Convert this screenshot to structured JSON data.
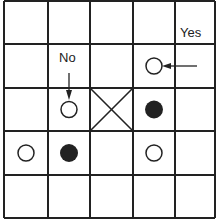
{
  "board": {
    "rows": 5,
    "cols": 5,
    "x_lines": [
      4,
      48,
      90,
      133,
      175,
      215
    ],
    "y_lines": [
      1,
      44,
      88,
      131,
      175,
      218
    ],
    "line_color": "#222222",
    "stones": [
      {
        "row": 1,
        "col": 3,
        "type": "open"
      },
      {
        "row": 2,
        "col": 1,
        "type": "open"
      },
      {
        "row": 2,
        "col": 3,
        "type": "filled"
      },
      {
        "row": 3,
        "col": 0,
        "type": "open"
      },
      {
        "row": 3,
        "col": 1,
        "type": "filled"
      },
      {
        "row": 3,
        "col": 3,
        "type": "open"
      }
    ],
    "crossed_cells": [
      {
        "row": 2,
        "col": 2
      }
    ]
  },
  "labels": {
    "no": "No",
    "yes": "Yes"
  }
}
